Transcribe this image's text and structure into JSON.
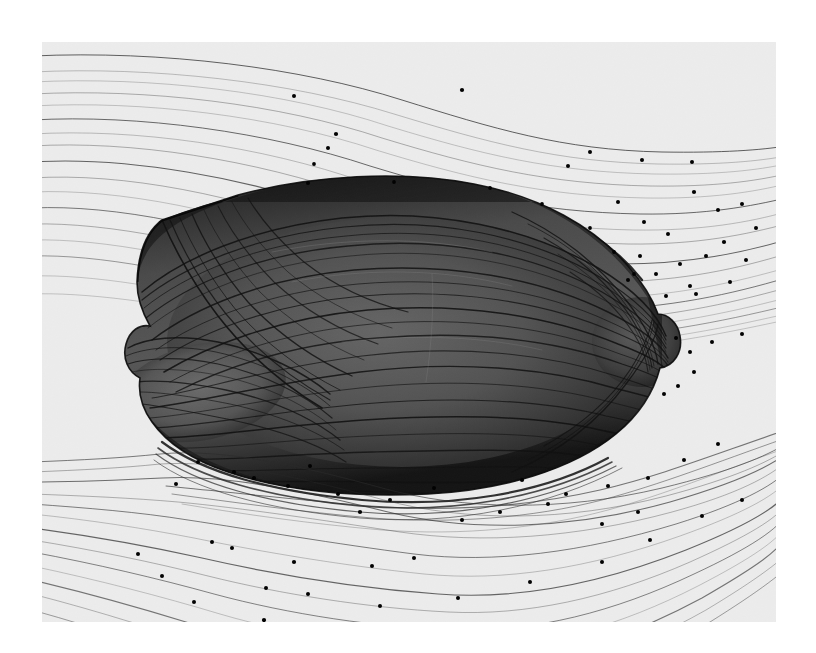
{
  "figure": {
    "domain_type": "scientific-visualization",
    "title": "",
    "caption": "",
    "canvas": {
      "background_color": "#ececec",
      "page_background_color": "#ffffff",
      "left": 42,
      "top": 42,
      "width": 734,
      "height": 580
    },
    "body": {
      "name": "bluff-body",
      "fill_color": "#4d4d4d",
      "shadow_color": "#2b2b2b",
      "highlight_color": "#6b6b6b",
      "outline_color": "#111111",
      "bbox": {
        "x": 95,
        "y": 175,
        "width": 550,
        "height": 290
      }
    },
    "streamlines": {
      "line_color": "#2a2a2a",
      "marker_color": "#000000",
      "marker_radius": 2.1,
      "freestream_opacity": 0.45,
      "surface_opacity": 0.85
    },
    "chart_data": {
      "type": "line",
      "title": "",
      "subtitle": "",
      "xlabel": "",
      "ylabel": "",
      "legend": [],
      "annotations": [],
      "grid": false,
      "description": "Grayscale flow-visualization: surface and freestream streamlines traced around a rounded bluff body; small filled dots mark streamline termination / direction markers.",
      "series": [
        {
          "name": "freestream-upper",
          "values": []
        },
        {
          "name": "freestream-lower",
          "values": []
        },
        {
          "name": "surface-streamlines",
          "values": []
        }
      ]
    }
  }
}
